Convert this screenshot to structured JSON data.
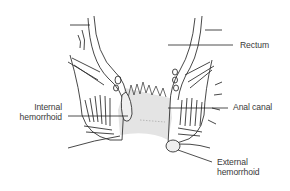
{
  "diagram": {
    "type": "anatomical illustration",
    "background_color": "#ffffff",
    "line_color": "#333333",
    "canal_fill_color": "#e4e4e4",
    "labels": {
      "rectum": "Rectum",
      "anal_canal": "Anal canal",
      "internal_hemorrhoid_line1": "Internal",
      "internal_hemorrhoid_line2": "hemorrhoid",
      "external_hemorrhoid_line1": "External",
      "external_hemorrhoid_line2": "hemorrhoid"
    }
  }
}
